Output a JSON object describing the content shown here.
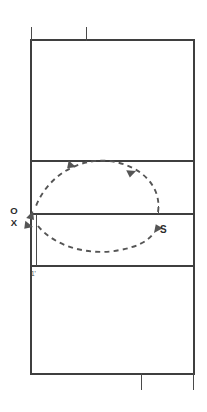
{
  "diagram": {
    "type": "court-play-diagram",
    "colors": {
      "court_line": "#3f3f3f",
      "motion_path": "#555555",
      "label": "#2b2b2b",
      "background": "#ffffff"
    },
    "labels": {
      "player_o": "O",
      "player_x": "X",
      "setter": "S",
      "distance_mark": "1'"
    },
    "court": {
      "outer": {
        "x": 31,
        "y": 40,
        "width": 163,
        "height": 334
      },
      "lines": [
        {
          "name": "end-line-top",
          "y": 40
        },
        {
          "name": "attack-line-upper",
          "y": 161
        },
        {
          "name": "center-line",
          "y": 214
        },
        {
          "name": "attack-line-lower",
          "y": 266
        },
        {
          "name": "end-line-bottom",
          "y": 374
        }
      ],
      "ticks": [
        {
          "name": "net-post-tick-top-left",
          "x": 31,
          "y1": 28,
          "y2": 40
        },
        {
          "name": "net-post-tick-top-center",
          "x": 86,
          "y1": 28,
          "y2": 40
        },
        {
          "name": "net-post-tick-bottom-center",
          "x": 141,
          "y1": 374,
          "y2": 389
        },
        {
          "name": "net-post-tick-bottom-right",
          "x": 194,
          "y1": 374,
          "y2": 389
        },
        {
          "name": "center-line-tick",
          "x": 158,
          "y1": 207,
          "y2": 214
        }
      ],
      "sideline_mark": {
        "name": "one-foot-line",
        "x": 36,
        "y1": 214,
        "y2": 266
      }
    },
    "motion": {
      "name": "setter-loop-path",
      "description": "Dashed elliptical loop from setter position S counterclockwise to receiving players O and X",
      "arrows": [
        {
          "name": "arrow-upper-left",
          "x": 73,
          "y": 168,
          "angle": -150
        },
        {
          "name": "arrow-upper-right",
          "x": 133,
          "y": 172,
          "angle": 195
        },
        {
          "name": "arrow-left-down",
          "x": 34,
          "y": 209,
          "angle": 125
        },
        {
          "name": "arrow-left-in",
          "x": 36,
          "y": 228,
          "angle": 195
        },
        {
          "name": "arrow-to-setter",
          "x": 150,
          "y": 236,
          "angle": -45
        }
      ]
    }
  }
}
